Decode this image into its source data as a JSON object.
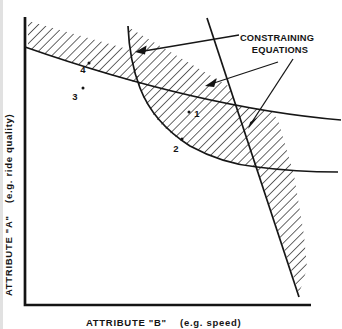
{
  "annotation": {
    "line1": "CONSTRAINING",
    "line2": "EQUATIONS"
  },
  "axes": {
    "y": {
      "label": "ATTRIBUTE \"A\"",
      "sublabel": "(e.g. ride quality)"
    },
    "x": {
      "label": "ATTRIBUTE \"B\"",
      "sublabel": "(e.g. speed)"
    }
  },
  "points": [
    {
      "label": "1"
    },
    {
      "label": "2"
    },
    {
      "label": "3"
    },
    {
      "label": "4"
    }
  ],
  "colors": {
    "ink": "#161616",
    "background": "#ffffff"
  }
}
